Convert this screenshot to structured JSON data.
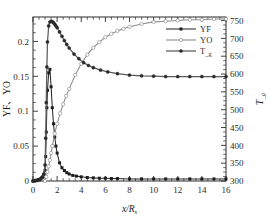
{
  "chart_data": {
    "type": "line",
    "title": "",
    "xlabel": "x/R",
    "xlabel_sub": "s",
    "ylabel_left": "YF、YO",
    "ylabel_right": "T_g",
    "ylabel_right_main": "T",
    "ylabel_right_sub": "g",
    "grid": false,
    "legend_position": "upper-right-inside",
    "xlim": [
      0,
      16
    ],
    "xticks": [
      0,
      2,
      4,
      6,
      8,
      10,
      12,
      14,
      16
    ],
    "xticklabels": [
      "0",
      "2",
      "4",
      "6",
      "8",
      "10",
      "12",
      "14",
      "16"
    ],
    "x_minor_step": 0.5,
    "ylim_left": [
      0,
      0.235
    ],
    "yticks_left": [
      0,
      0.05,
      0.1,
      0.15,
      0.2
    ],
    "yticklabels_left": [
      "0",
      "0.05",
      "0.1",
      "0.15",
      "0.2"
    ],
    "y_left_minor_step": 0.0125,
    "ylim_right": [
      300,
      760
    ],
    "yticks_right": [
      300,
      350,
      400,
      450,
      500,
      550,
      600,
      650,
      700,
      750
    ],
    "yticklabels_right": [
      "300",
      "350",
      "400",
      "450",
      "500",
      "550",
      "600",
      "650",
      "700",
      "750"
    ],
    "y_right_minor_step": 12.5,
    "series": [
      {
        "name": "YF",
        "label": "YF",
        "color": "#2a2a2a",
        "marker": "filled-square",
        "axis": "left",
        "x": [
          0.0,
          0.1,
          0.2,
          0.3,
          0.4,
          0.5,
          0.6,
          0.7,
          0.8,
          0.9,
          1.0,
          1.05,
          1.1,
          1.15,
          1.2,
          1.3,
          1.4,
          1.5,
          1.6,
          1.7,
          1.8,
          1.9,
          2.0,
          2.2,
          2.4,
          2.6,
          2.8,
          3.0,
          3.3,
          3.6,
          4.0,
          4.5,
          5.0,
          5.5,
          6.0,
          6.5,
          7.0,
          8.0,
          9.0,
          10.0,
          11.0,
          12.0,
          13.0,
          14.0,
          15.0,
          16.0
        ],
        "y": [
          0.0,
          0.0,
          0.0005,
          0.001,
          0.0015,
          0.002,
          0.003,
          0.0045,
          0.006,
          0.009,
          0.015,
          0.035,
          0.07,
          0.105,
          0.13,
          0.155,
          0.16,
          0.135,
          0.105,
          0.082,
          0.063,
          0.05,
          0.04,
          0.026,
          0.019,
          0.015,
          0.012,
          0.01,
          0.008,
          0.007,
          0.006,
          0.005,
          0.0045,
          0.004,
          0.004,
          0.0035,
          0.0035,
          0.003,
          0.003,
          0.003,
          0.003,
          0.003,
          0.003,
          0.003,
          0.003,
          0.003
        ]
      },
      {
        "name": "YO",
        "label": "YO",
        "color": "#8d8d8d",
        "marker": "open-circle",
        "axis": "left",
        "x": [
          1.0,
          1.1,
          1.2,
          1.3,
          1.4,
          1.5,
          1.6,
          1.8,
          2.0,
          2.25,
          2.5,
          2.75,
          3.0,
          3.5,
          4.0,
          4.5,
          5.0,
          5.5,
          6.0,
          6.5,
          7.0,
          7.5,
          8.0,
          9.0,
          10.0,
          11.0,
          12.0,
          13.0,
          14.0,
          15.0,
          16.0
        ],
        "y": [
          0.0,
          0.006,
          0.013,
          0.021,
          0.03,
          0.04,
          0.05,
          0.068,
          0.082,
          0.097,
          0.11,
          0.122,
          0.132,
          0.152,
          0.168,
          0.181,
          0.191,
          0.199,
          0.206,
          0.211,
          0.215,
          0.218,
          0.221,
          0.225,
          0.228,
          0.229,
          0.23,
          0.231,
          0.231,
          0.232,
          0.232
        ]
      },
      {
        "name": "T_g",
        "label": "T_g",
        "label_main": "T",
        "label_sub": "g",
        "color": "#4a4a4a",
        "marker": "filled-circle",
        "axis": "right",
        "x": [
          0.0,
          0.2,
          0.4,
          0.6,
          0.8,
          0.9,
          1.0,
          1.05,
          1.1,
          1.15,
          1.2,
          1.3,
          1.4,
          1.5,
          1.6,
          1.7,
          1.8,
          1.9,
          2.0,
          2.2,
          2.4,
          2.6,
          2.8,
          3.0,
          3.4,
          3.8,
          4.2,
          4.6,
          5.0,
          5.6,
          6.2,
          7.0,
          8.0,
          9.0,
          10.0,
          11.0,
          12.0,
          13.0,
          14.0,
          15.0,
          16.0
        ],
        "y": [
          300,
          301,
          302,
          304,
          310,
          320,
          345,
          420,
          520,
          620,
          690,
          735,
          746,
          748,
          747,
          744,
          740,
          735,
          730,
          718,
          706,
          694,
          683,
          673,
          656,
          643,
          632,
          624,
          618,
          611,
          606,
          601,
          597,
          595,
          594,
          593,
          593,
          593,
          593,
          593,
          593
        ]
      }
    ]
  },
  "legend": {
    "items": [
      {
        "label": "YF",
        "marker": "filled-square"
      },
      {
        "label": "YO",
        "marker": "open-circle"
      },
      {
        "label_main": "T",
        "label_sub": "g",
        "marker": "filled-circle"
      }
    ]
  }
}
